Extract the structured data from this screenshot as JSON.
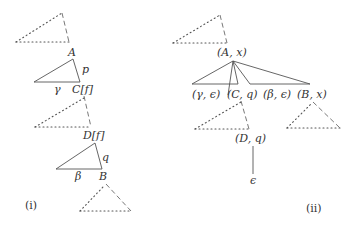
{
  "diagram_i": {
    "caption": "(i)",
    "labels": {
      "A": "A",
      "p": "p",
      "gamma": "γ",
      "C_f": "C[f]",
      "D_f": "D[f]",
      "q": "q",
      "beta": "β",
      "B": "B"
    }
  },
  "diagram_ii": {
    "caption": "(ii)",
    "labels": {
      "root": "(A, x)",
      "gamma_eps": "(γ, ϵ)",
      "C_q": "(C, q)",
      "beta_eps": "(β, ϵ)",
      "B_x": "(B, x)",
      "D_q": "(D, q)",
      "eps": "ϵ"
    }
  },
  "colors": {
    "stroke": "#555555",
    "text": "#333333",
    "background": "#ffffff"
  }
}
